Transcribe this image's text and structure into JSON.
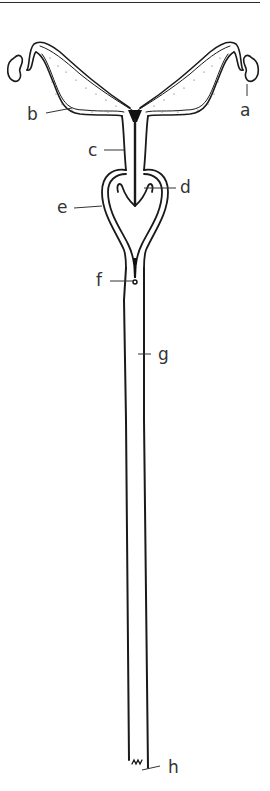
{
  "figure": {
    "type": "anatomical line drawing",
    "ink_color": "#1a1a1a",
    "label_color": "#333333",
    "labels": [
      {
        "id": "a",
        "text": "a"
      },
      {
        "id": "b",
        "text": "b"
      },
      {
        "id": "c",
        "text": "c"
      },
      {
        "id": "d",
        "text": "d"
      },
      {
        "id": "e",
        "text": "e"
      },
      {
        "id": "f",
        "text": "f"
      },
      {
        "id": "g",
        "text": "g"
      },
      {
        "id": "h",
        "text": "h"
      }
    ]
  }
}
